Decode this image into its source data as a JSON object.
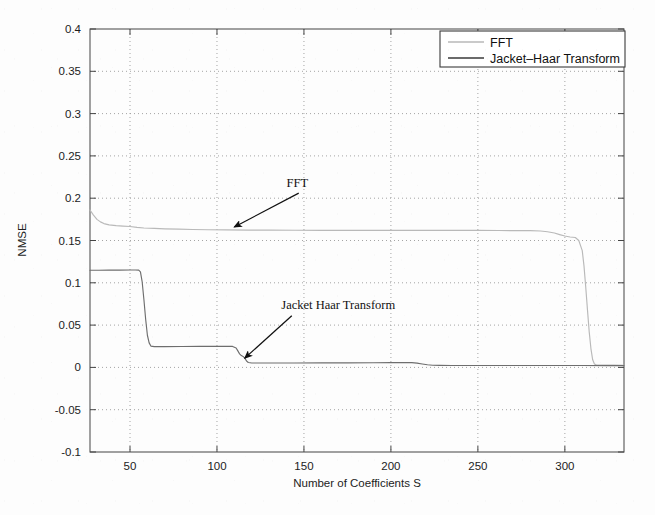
{
  "chart_data": {
    "type": "line",
    "title": "",
    "xlabel": "Number of Coefficients S",
    "ylabel": "NMSE",
    "xlim": [
      27,
      334
    ],
    "ylim": [
      -0.1,
      0.4
    ],
    "xticks": [
      50,
      100,
      150,
      200,
      250,
      300
    ],
    "xtick_labels": [
      "50",
      "100",
      "150",
      "200",
      "250",
      "300"
    ],
    "yticks": [
      -0.1,
      -0.05,
      0,
      0.05,
      0.1,
      0.15,
      0.2,
      0.25,
      0.3,
      0.35,
      0.4
    ],
    "ytick_labels": [
      "-0.1",
      "-0.05",
      "0",
      "0.05",
      "0.1",
      "0.15",
      "0.2",
      "0.25",
      "0.3",
      "0.35",
      "0.4"
    ],
    "grid": true,
    "grid_style": "dotted",
    "legend_position": "top-right",
    "series": [
      {
        "name": "FFT",
        "color": "#b9b9b9",
        "points": [
          [
            27,
            0.186
          ],
          [
            29,
            0.18
          ],
          [
            31,
            0.175
          ],
          [
            33,
            0.172
          ],
          [
            35,
            0.17
          ],
          [
            38,
            0.1685
          ],
          [
            42,
            0.1675
          ],
          [
            46,
            0.167
          ],
          [
            50,
            0.1665
          ],
          [
            54,
            0.1655
          ],
          [
            58,
            0.1648
          ],
          [
            64,
            0.1643
          ],
          [
            70,
            0.1638
          ],
          [
            78,
            0.1634
          ],
          [
            86,
            0.163
          ],
          [
            95,
            0.1627
          ],
          [
            105,
            0.1625
          ],
          [
            118,
            0.1623
          ],
          [
            130,
            0.1622
          ],
          [
            145,
            0.1621
          ],
          [
            160,
            0.162
          ],
          [
            175,
            0.162
          ],
          [
            190,
            0.162
          ],
          [
            205,
            0.162
          ],
          [
            220,
            0.162
          ],
          [
            235,
            0.162
          ],
          [
            250,
            0.1619
          ],
          [
            262,
            0.1618
          ],
          [
            272,
            0.1617
          ],
          [
            280,
            0.1616
          ],
          [
            286,
            0.1612
          ],
          [
            290,
            0.1604
          ],
          [
            294,
            0.1588
          ],
          [
            297,
            0.157
          ],
          [
            300,
            0.1553
          ],
          [
            303,
            0.1542
          ],
          [
            306,
            0.1535
          ],
          [
            308,
            0.15
          ],
          [
            310,
            0.138
          ],
          [
            311,
            0.12
          ],
          [
            312,
            0.095
          ],
          [
            313,
            0.068
          ],
          [
            314,
            0.042
          ],
          [
            315,
            0.022
          ],
          [
            316,
            0.009
          ],
          [
            317,
            0.004
          ],
          [
            318,
            0.003
          ],
          [
            322,
            0.0028
          ],
          [
            328,
            0.0027
          ],
          [
            334,
            0.0026
          ]
        ]
      },
      {
        "name": "Jacket-Haar Transform",
        "color": "#6e6e6e",
        "points": [
          [
            27,
            0.1148
          ],
          [
            32,
            0.1148
          ],
          [
            38,
            0.1149
          ],
          [
            44,
            0.115
          ],
          [
            50,
            0.1151
          ],
          [
            53,
            0.1151
          ],
          [
            55,
            0.115
          ],
          [
            56,
            0.113
          ],
          [
            57,
            0.101
          ],
          [
            58,
            0.08
          ],
          [
            59,
            0.057
          ],
          [
            60,
            0.038
          ],
          [
            61,
            0.029
          ],
          [
            62,
            0.0252
          ],
          [
            64,
            0.0246
          ],
          [
            70,
            0.0246
          ],
          [
            80,
            0.0247
          ],
          [
            90,
            0.0248
          ],
          [
            100,
            0.0249
          ],
          [
            106,
            0.025
          ],
          [
            109,
            0.0248
          ],
          [
            111,
            0.023
          ],
          [
            112,
            0.0195
          ],
          [
            113,
            0.016
          ],
          [
            114,
            0.014
          ],
          [
            115,
            0.013
          ],
          [
            116,
            0.011
          ],
          [
            117,
            0.0075
          ],
          [
            118,
            0.0058
          ],
          [
            120,
            0.0052
          ],
          [
            130,
            0.0052
          ],
          [
            145,
            0.0052
          ],
          [
            160,
            0.0053
          ],
          [
            175,
            0.0054
          ],
          [
            190,
            0.0055
          ],
          [
            200,
            0.0056
          ],
          [
            208,
            0.0057
          ],
          [
            212,
            0.0056
          ],
          [
            215,
            0.005
          ],
          [
            218,
            0.004
          ],
          [
            221,
            0.0031
          ],
          [
            224,
            0.0026
          ],
          [
            228,
            0.0024
          ],
          [
            235,
            0.0023
          ],
          [
            250,
            0.0023
          ],
          [
            270,
            0.0022
          ],
          [
            290,
            0.0022
          ],
          [
            310,
            0.0022
          ],
          [
            325,
            0.0021
          ],
          [
            334,
            0.0021
          ]
        ]
      }
    ],
    "legend": [
      {
        "label": "FFT",
        "color": "#b9b9b9"
      },
      {
        "label": "Jacket–Haar Transform",
        "color": "#3a3a3a"
      }
    ],
    "annotations": [
      {
        "text": "FFT",
        "text_x": 140,
        "text_y": 0.213,
        "arrow_from_x": 147,
        "arrow_from_y": 0.206,
        "arrow_to_x": 110,
        "arrow_to_y": 0.166
      },
      {
        "text": "Jacket Haar Transform",
        "text_x": 137,
        "text_y": 0.069,
        "arrow_from_x": 143,
        "arrow_from_y": 0.061,
        "arrow_to_x": 116,
        "arrow_to_y": 0.011
      }
    ]
  }
}
